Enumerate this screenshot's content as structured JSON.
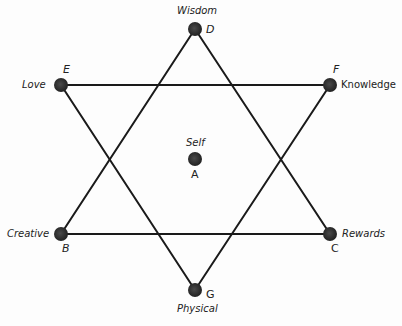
{
  "diagram": {
    "type": "hexagram",
    "line_color": "#1a1a1a",
    "node_color": "#2a2a2a",
    "nodes": {
      "A": {
        "letter": "A",
        "label": "Self",
        "x": 195,
        "y": 159
      },
      "B": {
        "letter": "B",
        "label": "Creative",
        "x": 61,
        "y": 234
      },
      "C": {
        "letter": "C",
        "label": "Rewards",
        "x": 330,
        "y": 234
      },
      "D": {
        "letter": "D",
        "label": "Wisdom",
        "x": 195,
        "y": 29
      },
      "E": {
        "letter": "E",
        "label": "Love",
        "x": 61,
        "y": 85
      },
      "F": {
        "letter": "F",
        "label": "Knowledge",
        "x": 330,
        "y": 85
      },
      "G": {
        "letter": "G",
        "label": "Physical",
        "x": 195,
        "y": 290
      }
    },
    "triangles": [
      {
        "name": "upward",
        "vertices": [
          "D",
          "B",
          "C"
        ]
      },
      {
        "name": "downward",
        "vertices": [
          "E",
          "F",
          "G"
        ]
      }
    ]
  }
}
